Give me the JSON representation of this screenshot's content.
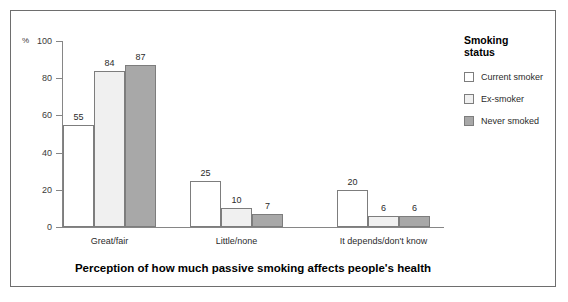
{
  "chart_data": {
    "type": "bar",
    "title": "",
    "xlabel": "Perception of how much passive smoking affects people's health",
    "ylabel": "%",
    "categories": [
      "Great/fair",
      "Little/none",
      "It depends/don't know"
    ],
    "series": [
      {
        "name": "Current smoker",
        "values": [
          55,
          25,
          20
        ],
        "color": "#ffffff"
      },
      {
        "name": "Ex-smoker",
        "values": [
          84,
          10,
          6
        ],
        "color": "#f0f0f0"
      },
      {
        "name": "Never smoked",
        "values": [
          87,
          7,
          6
        ],
        "color": "#a8a8a8"
      }
    ],
    "ylim": [
      0,
      100
    ],
    "yticks": [
      0,
      20,
      40,
      60,
      80,
      100
    ],
    "grid": false,
    "legend_position": "right",
    "legend_title": "Smoking\nstatus",
    "data_labels": true
  },
  "axis": {
    "unit_symbol": "%",
    "tick_labels": [
      "100",
      "80",
      "60",
      "40",
      "20",
      "0"
    ]
  },
  "legend": {
    "title": "Smoking\nstatus",
    "items": [
      {
        "label": "Current smoker"
      },
      {
        "label": "Ex-smoker"
      },
      {
        "label": "Never smoked"
      }
    ]
  },
  "caption": "Perception of how much passive smoking affects people's health"
}
